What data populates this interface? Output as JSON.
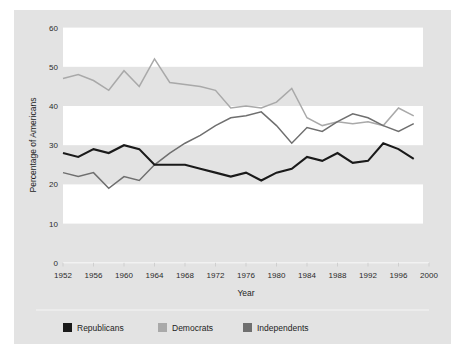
{
  "figure": {
    "panel_bg": "#e3e3e3",
    "band_color": "#ffffff",
    "page_bg": "#ffffff"
  },
  "axes": {
    "y_title": "Percentage of Americans",
    "x_title": "Year",
    "y_ticks": [
      "0",
      "10",
      "20",
      "30",
      "40",
      "50",
      "60"
    ],
    "x_ticks": [
      "1952",
      "1956",
      "1960",
      "1964",
      "1968",
      "1972",
      "1976",
      "1980",
      "1984",
      "1988",
      "1992",
      "1996",
      "2000"
    ]
  },
  "legend": {
    "items": [
      {
        "label": "Republicans",
        "color": "#1a1a1a"
      },
      {
        "label": "Democrats",
        "color": "#a9a9a9"
      },
      {
        "label": "Independents",
        "color": "#6f6f6f"
      }
    ]
  },
  "chart_data": {
    "type": "line",
    "title": "",
    "subtitle": "",
    "xlabel": "Year",
    "ylabel": "Percentage of Americans",
    "xlim": [
      1952,
      2000
    ],
    "ylim": [
      0,
      60
    ],
    "y_ticks": [
      0,
      10,
      20,
      30,
      40,
      50,
      60
    ],
    "x_ticks": [
      1952,
      1956,
      1960,
      1964,
      1968,
      1972,
      1976,
      1980,
      1984,
      1988,
      1992,
      1996,
      2000
    ],
    "grid": "alternating horizontal bands (white on 10-20, 30-40, 50-60)",
    "legend_position": "below plot, horizontal",
    "x": [
      1952,
      1954,
      1956,
      1958,
      1960,
      1962,
      1964,
      1966,
      1968,
      1970,
      1972,
      1974,
      1976,
      1978,
      1980,
      1982,
      1984,
      1986,
      1988,
      1990,
      1992,
      1994,
      1996,
      1998
    ],
    "series": [
      {
        "name": "Republicans",
        "color": "#1a1a1a",
        "values": [
          28,
          27,
          29,
          28,
          30,
          29,
          25,
          25,
          25,
          24,
          23,
          22,
          23,
          21,
          23,
          24,
          27,
          26,
          28,
          25.5,
          26,
          30.5,
          29,
          26.5
        ]
      },
      {
        "name": "Democrats",
        "color": "#a9a9a9",
        "values": [
          47,
          48,
          46.5,
          44,
          49,
          45,
          52,
          46,
          45.5,
          45,
          44,
          39.5,
          40,
          39.5,
          41,
          44.5,
          37,
          35,
          36,
          35.5,
          36,
          35,
          39.5,
          37.5
        ]
      },
      {
        "name": "Independents",
        "color": "#6f6f6f",
        "values": [
          23,
          22,
          23,
          19,
          22,
          21,
          25,
          28,
          30.5,
          32.5,
          35,
          37,
          37.5,
          38.5,
          35,
          30.5,
          34.5,
          33.5,
          36,
          38,
          37,
          35,
          33.5,
          35.5
        ]
      }
    ]
  }
}
